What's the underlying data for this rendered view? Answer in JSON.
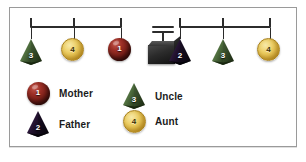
{
  "figure": {
    "top_cropped_text": "",
    "frame_border_color": "#9a9a9a",
    "background_color": "#ffffff"
  },
  "colors": {
    "mother_sphere": "#7a1f18",
    "father_pyramid": "#241331",
    "uncle_pyramid": "#4c6b3c",
    "aunt_circle": "#e3c04a",
    "beam": "#2c2c2c",
    "fulcrum": "#1a1a1a"
  },
  "mobiles": [
    {
      "name": "left-mobile",
      "nodes": [
        {
          "id": "left-node-1",
          "number": "3",
          "shape": "pyramid",
          "role": "Uncle"
        },
        {
          "id": "left-node-2",
          "number": "4",
          "shape": "circle",
          "role": "Aunt"
        },
        {
          "id": "left-node-3",
          "number": "1",
          "shape": "sphere",
          "role": "Mother"
        }
      ]
    },
    {
      "name": "right-mobile",
      "nodes": [
        {
          "id": "right-node-1",
          "number": "2",
          "shape": "pyramid",
          "role": "Father"
        },
        {
          "id": "right-node-2",
          "number": "3",
          "shape": "pyramid",
          "role": "Uncle"
        },
        {
          "id": "right-node-3",
          "number": "4",
          "shape": "circle",
          "role": "Aunt"
        }
      ]
    }
  ],
  "fulcrum": {
    "name": "balance-fulcrum",
    "shape": "cube-with-post"
  },
  "legend": {
    "items": [
      {
        "number": "1",
        "label": "Mother",
        "shape": "sphere"
      },
      {
        "number": "2",
        "label": "Father",
        "shape": "pyramid"
      },
      {
        "number": "3",
        "label": "Uncle",
        "shape": "pyramid"
      },
      {
        "number": "4",
        "label": "Aunt",
        "shape": "circle"
      }
    ]
  }
}
